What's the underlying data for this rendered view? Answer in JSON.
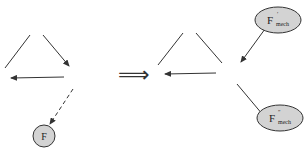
{
  "left_diagram": {
    "node_label": "F",
    "description": "Triangle of arrows with dashed arrow to node F"
  },
  "transition": {
    "symbol": "⟹"
  },
  "right_diagram": {
    "node_top": {
      "base": "F",
      "sup": "′",
      "sub": "mech"
    },
    "node_bottom": {
      "base": "F",
      "sup": "″",
      "sub": "mech"
    }
  },
  "colors": {
    "line": "#333333",
    "node_fill": "#d3d3d3",
    "node_stroke": "#333333"
  }
}
